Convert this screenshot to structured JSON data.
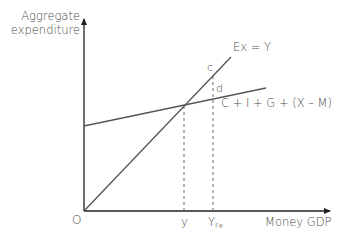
{
  "diagram": {
    "y_axis_label_line1": "Aggregate",
    "y_axis_label_line2": "expenditure",
    "x_axis_label": "Money GDP",
    "origin_label": "O",
    "line_45_label": "Ex = Y",
    "ae_line_label": "C + I + G + (X – M)",
    "point_c_label": "c",
    "point_d_label": "d",
    "x_tick_equilibrium": "y",
    "x_tick_full_employment_main": "Y",
    "x_tick_full_employment_sub": "Fe",
    "colors": {
      "axis": "#222222",
      "lines": "#555555",
      "dashed": "#666666",
      "text": "#4a4a4a"
    }
  }
}
